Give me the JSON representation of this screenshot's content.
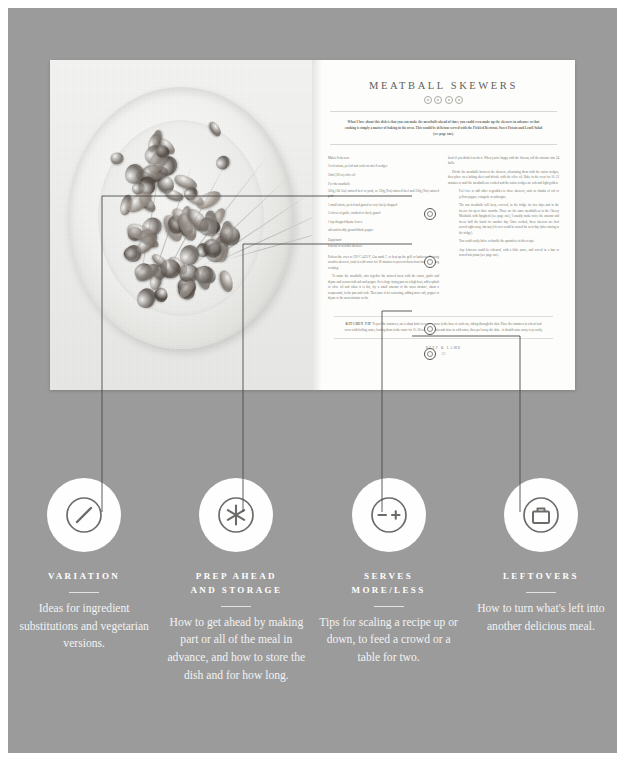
{
  "colors": {
    "canvas_bg": "#9b9b9b",
    "page_bg": "#fdfdfb",
    "ink": "#5d5d5a",
    "legend_text": "#ffffff",
    "line": "#4a4a48"
  },
  "spread": {
    "recipe_title": "MEATBALL SKEWERS",
    "title_icons": [
      "variation-icon",
      "prep-ahead-icon",
      "serves-more-less-icon",
      "leftovers-icon"
    ],
    "intro": "What I love about this dish is that you can make the meatballs ahead of time; you could even make up the skewers in advance so that cooking is simply a matter of baking in the oven. This would be delicious served with the Pickled Beetroot, Sweet Potato and Lentil Salad (see page one).",
    "left_column": {
      "serves": "Makes 8 skewers",
      "ingredients_main": [
        "3 red onions, peeled and each cut into 8 wedges",
        "50ml (2fl oz) olive oil"
      ],
      "subhead_meatballs": "For the meatballs",
      "ingredients_meatballs": [
        "500g (1lb 2oz) minced beef or pork, or 250g (9oz) minced beef and 250g (9oz) minced pork",
        "1 small onion, peeled and grated or very finely chopped",
        "2 cloves of garlic, crushed or finely grated",
        "1 tsp chopped thyme leaves",
        "salt and freshly ground black pepper"
      ],
      "subhead_equipment": "Equipment",
      "equipment": "8 metal or wooden skewers",
      "method": [
        "Preheat the oven to 220°C (425°F, Gas mark 7, or heat up the grill or barbecue. If using wooden skewers, soak in cold water for 30 minutes to prevent them from burning during cooking.",
        "To make the meatballs, mix together the minced meat with the onion, garlic and thyme and season with salt and pepper. Set a large frying pan on a high heat, add a splash of olive oil and when it is hot, fry a small amount of the meat mixture, about a teaspoonful, in the pan and cook. Then taste it for seasoning, adding more salt, pepper or thyme to the meat mixture to the"
      ]
    },
    "right_column": {
      "method_cont": [
        "bowl if you think it needs it. When you're happy with the flavour, roll the mixture into 24 balls.",
        "Divide the meatballs between the skewers, alternating them with the onion wedges, then place on a baking sheet and drizzle with the olive oil. Bake in the oven for 10–12 minutes or until the meatballs are cooked and the onion wedges are soft and light golden."
      ],
      "annotations": [
        {
          "icon": "variation-icon",
          "text": "Feel free to add other vegetables to these skewers, such as chunks of red or yellow pepper, courgette or aubergine."
        },
        {
          "icon": "prep-ahead-icon",
          "text": "The raw meatballs will keep, covered, in the fridge for two days and in the freezer for up to three months. These are the same meatballs as in the Cheesy Meatballs with Spaghetti (see page one), I usually make twice the amount and freeze half the batch for another day. Once cooked, these skewers are best served right away, but any left over could be tossed the next day (after storing in the fridge)."
        },
        {
          "icon": "serves-more-less-icon",
          "text": "You could easily halve or double the quantities in this recipe."
        },
        {
          "icon": "leftovers-icon",
          "text": "Any leftovers could be reheated, with a little sauce, and served in a bun or tossed into pasta (see page one)."
        }
      ]
    },
    "kitchen_tip": {
      "label": "KITCHEN TIP",
      "text": "To peel the tomatoes, use a sharp knife to score a cross in the base of each one, taking through the skin. Place the tomatoes in a bowl and cover with boiling water, leaving them in the water for 15–20 seconds. Drain and rinse in cold water, then peel away the skin – it should come away very easily."
    },
    "folio": {
      "chapter": "BEEF & LAMB",
      "page_number": "121"
    }
  },
  "legend": {
    "items": [
      {
        "icon": "variation-icon",
        "title": "VARIATION",
        "description": "Ideas for ingredient substitutions and vegetarian versions."
      },
      {
        "icon": "prep-ahead-icon",
        "title": "PREP AHEAD\nAND STORAGE",
        "description": "How to get ahead by making part or all of the meal in advance, and how to store the dish and for how long."
      },
      {
        "icon": "serves-more-less-icon",
        "title": "SERVES\nMORE/LESS",
        "description": "Tips for scaling a recipe up or down, to feed a crowd or a table for two."
      },
      {
        "icon": "leftovers-icon",
        "title": "LEFTOVERS",
        "description": "How to turn what's left into another delicious meal."
      }
    ]
  }
}
